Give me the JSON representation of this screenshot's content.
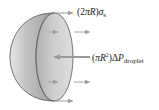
{
  "diagram": {
    "shape": "hemisphere",
    "colors": {
      "shell_fill": "#b9b9b9",
      "face_fill": "#c8c8c8",
      "outline": "#555555",
      "arrow": "#9a9a9a",
      "text": "#222222"
    },
    "labels": {
      "surface_tension": {
        "prefix": "(2",
        "pi": "π",
        "R": "R",
        "close": ")",
        "sigma": "σ",
        "sub": "s"
      },
      "pressure": {
        "open": "(",
        "pi": "π",
        "R": "R",
        "exp": "2",
        "close": ")",
        "delta": "Δ",
        "P": "P",
        "sub": "droplet"
      }
    },
    "arrows": [
      {
        "name": "surface-tension-top",
        "direction": "right",
        "y": 13
      },
      {
        "name": "surface-tension-upper",
        "direction": "right",
        "y": 32
      },
      {
        "name": "pressure-force",
        "direction": "left",
        "y": 57
      },
      {
        "name": "surface-tension-lower",
        "direction": "right",
        "y": 82
      },
      {
        "name": "surface-tension-bottom",
        "direction": "right",
        "y": 101
      }
    ]
  }
}
